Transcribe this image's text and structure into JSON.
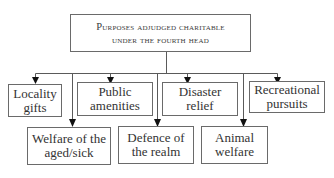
{
  "diagram": {
    "title_line1": "Purposes adjudged charitable",
    "title_line2": "under the fourth head",
    "top_row": [
      {
        "line1": "Locality",
        "line2": "gifts"
      },
      {
        "line1": "Public",
        "line2": "amenities"
      },
      {
        "line1": "Disaster",
        "line2": "relief"
      },
      {
        "line1": "Recreational",
        "line2": "pursuits"
      }
    ],
    "bottom_row": [
      {
        "line1": "Welfare of the",
        "line2": "aged/sick"
      },
      {
        "line1": "Defence of",
        "line2": "the realm"
      },
      {
        "line1": "Animal",
        "line2": "welfare"
      }
    ],
    "colors": {
      "line": "#5a5a5a",
      "arrow": "#111111",
      "border": "#6a6a6a",
      "text": "#333333"
    }
  }
}
